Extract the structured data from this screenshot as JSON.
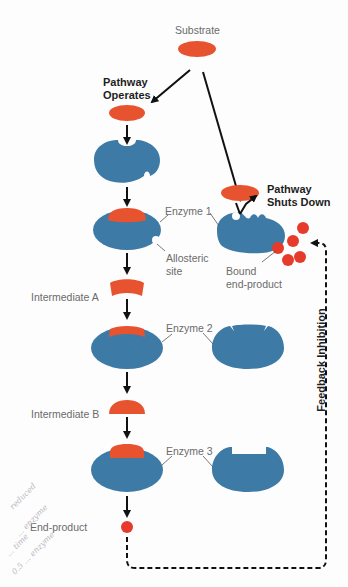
{
  "diagram": {
    "type": "metabolic-pathway-feedback-inhibition",
    "colors": {
      "enzyme": "#3d7aa6",
      "substrate": "#e8532f",
      "end_product": "#e63b2a",
      "arrow": "#111111",
      "label_text": "#6b6b6b",
      "bold_text": "#1e1e1e"
    },
    "labels": {
      "substrate": "Substrate",
      "pathway_operates_line1": "Pathway",
      "pathway_operates_line2": "Operates",
      "pathway_shuts_down_line1": "Pathway",
      "pathway_shuts_down_line2": "Shuts Down",
      "enzyme_1": "Enzyme 1",
      "allosteric_site_line1": "Allosteric",
      "allosteric_site_line2": "site",
      "bound_end_product_line1": "Bound",
      "bound_end_product_line2": "end-product",
      "intermediate_a": "Intermediate A",
      "enzyme_2": "Enzyme 2",
      "intermediate_b": "Intermediate B",
      "enzyme_3": "Enzyme 3",
      "end_product": "End-product",
      "feedback_inhibition": "Feedback Inhibition"
    },
    "handwritten_notes": [
      "reduced",
      "... enzyme",
      "... time",
      "0.5 ... enzyme"
    ],
    "nodes": [
      {
        "id": "substrate",
        "shape": "ellipse",
        "color": "substrate"
      },
      {
        "id": "substrate-copy-left",
        "shape": "ellipse",
        "color": "substrate"
      },
      {
        "id": "enzyme1-free",
        "shape": "enzyme-with-active-site-and-allosteric-site"
      },
      {
        "id": "enzyme1-bound-substrate",
        "shape": "enzyme-substrate-complex"
      },
      {
        "id": "enzyme1-inhibited",
        "shape": "enzyme-distorted-by-end-product"
      },
      {
        "id": "intermediate-a",
        "shape": "curved-bar"
      },
      {
        "id": "enzyme2-bound",
        "shape": "enzyme-substrate-complex"
      },
      {
        "id": "enzyme2-free",
        "shape": "enzyme-notched"
      },
      {
        "id": "intermediate-b",
        "shape": "dome"
      },
      {
        "id": "enzyme3-bound",
        "shape": "enzyme-substrate-complex"
      },
      {
        "id": "enzyme3-free",
        "shape": "enzyme-rect-pocket"
      },
      {
        "id": "end-product",
        "shape": "circle",
        "color": "end_product"
      }
    ],
    "edges": [
      {
        "from": "substrate",
        "to": "substrate-copy-left",
        "style": "solid-arrow"
      },
      {
        "from": "substrate",
        "to": "enzyme1-inhibited",
        "style": "solid-arrow"
      },
      {
        "from": "substrate-copy-left",
        "to": "enzyme1-free",
        "style": "solid-arrow"
      },
      {
        "from": "enzyme1-free",
        "to": "enzyme1-bound-substrate",
        "style": "solid-arrow"
      },
      {
        "from": "enzyme1-bound-substrate",
        "to": "intermediate-a",
        "style": "solid-arrow"
      },
      {
        "from": "intermediate-a",
        "to": "enzyme2-bound",
        "style": "solid-arrow"
      },
      {
        "from": "enzyme2-bound",
        "to": "intermediate-b",
        "style": "solid-arrow"
      },
      {
        "from": "intermediate-b",
        "to": "enzyme3-bound",
        "style": "solid-arrow"
      },
      {
        "from": "enzyme3-bound",
        "to": "end-product",
        "style": "solid-arrow"
      },
      {
        "from": "end-product",
        "to": "enzyme1-inhibited",
        "style": "dashed-arrow",
        "label": "Feedback Inhibition"
      }
    ]
  }
}
